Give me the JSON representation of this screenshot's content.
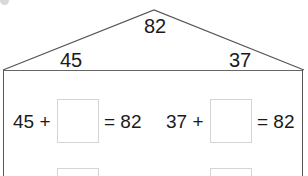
{
  "roof": {
    "top_value": "82",
    "left_value": "45",
    "right_value": "37"
  },
  "equations": [
    {
      "addend": "45 +",
      "answer": "",
      "result": "= 82"
    },
    {
      "addend": "37 +",
      "answer": "",
      "result": "= 82"
    }
  ],
  "colors": {
    "line": "#555555",
    "box_border": "#d4d4d4",
    "text": "#1a1a1a"
  }
}
